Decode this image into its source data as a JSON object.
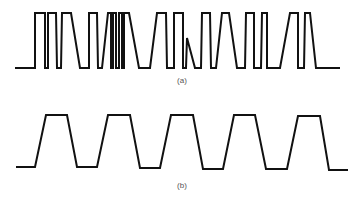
{
  "figure": {
    "panels": [
      {
        "id": "a",
        "label": "(a)",
        "description": "Irregular pulse train with rapid and slanted transitions",
        "high_y": 13,
        "low_y": 68,
        "points": "15,68 35,68 35,13 45,13 45,68 48,68 48,13 56,13 57,68 61,68 62,13 71,13 80,68 89,68 89,13 97,13 98,68 102,68 108,13 111,13 111,68 113,68 113,13 116,13 116,68 119,68 119,13 122,13 122,68 124,68 124,13 129,13 139,68 150,68 157,13 166,13 167,68 174,68 174,13 183,13 183,68 186,68 187,38 195,68 201,68 202,13 210,13 211,68 216,68 222,13 229,13 237,68 245,68 246,13 254,13 254,68 261,68 262,13 267,13 267,68 280,68 290,13 298,13 298,68 304,68 305,13 310,13 316,68 340,68"
      },
      {
        "id": "b",
        "label": "(b)",
        "description": "Regular trapezoidal pulse train, five pulses",
        "high_y": 115,
        "low_y": 168,
        "points": "16,167 35,167 46,115 67,115 77,167 97,167 108,115 130,115 140,168 160,168 171,115 193,115 203,169 223,169 234,115 255,115 266,169 287,169 298,116 320,116 329,170 348,170"
      }
    ]
  }
}
